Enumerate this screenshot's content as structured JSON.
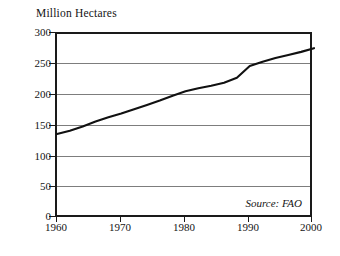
{
  "chart_data": {
    "type": "line",
    "title": "Million Hectares",
    "xlabel": "",
    "ylabel": "Million Hectares",
    "xlim": [
      1960,
      2000
    ],
    "ylim": [
      0,
      300
    ],
    "grid": true,
    "legend": false,
    "annotation": "Source: FAO",
    "y_ticks": [
      300,
      250,
      200,
      150,
      100,
      50,
      0
    ],
    "x_ticks": [
      1960,
      1970,
      1980,
      1990,
      2000
    ],
    "x": [
      1960,
      1962,
      1964,
      1966,
      1968,
      1970,
      1972,
      1974,
      1976,
      1978,
      1980,
      1982,
      1984,
      1986,
      1988,
      1990,
      1992,
      1994,
      1996,
      1998,
      2000
    ],
    "values": [
      138,
      143,
      150,
      158,
      165,
      171,
      178,
      185,
      192,
      200,
      207,
      212,
      216,
      221,
      229,
      248,
      255,
      261,
      266,
      271,
      277
    ],
    "series": [
      {
        "name": "Irrigated area",
        "values": [
          138,
          143,
          150,
          158,
          165,
          171,
          178,
          185,
          192,
          200,
          207,
          212,
          216,
          221,
          229,
          248,
          255,
          261,
          266,
          271,
          277
        ]
      }
    ],
    "line_color": "#111111"
  }
}
